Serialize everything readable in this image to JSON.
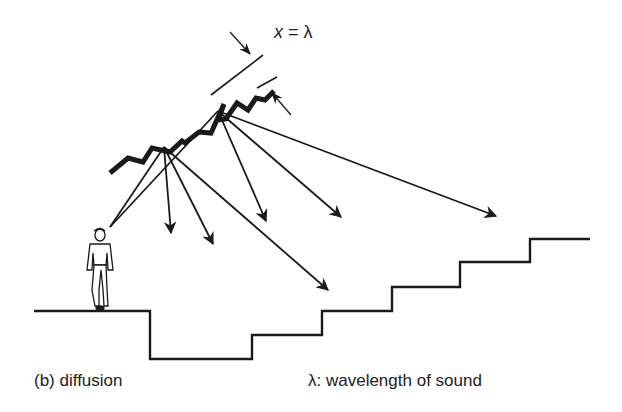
{
  "figure": {
    "panel_label": "(b) diffusion",
    "legend_note": "λ: wavelength of sound",
    "equation": {
      "variable": "x",
      "operator": "=",
      "value": "λ"
    }
  },
  "elements": {
    "diffuser_surface": "stepped sawtooth ceiling diffuser",
    "listener": "standing person on left ledge",
    "floor": "stepped floor / seating tiers"
  },
  "colors": {
    "ink": "#1a1a1a",
    "background": "#ffffff"
  }
}
